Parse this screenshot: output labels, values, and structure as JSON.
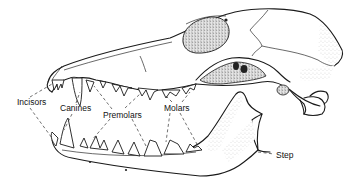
{
  "figure": {
    "ink_color": "#1a1a1a",
    "background": "#ffffff"
  },
  "labels": {
    "incisors": "Incisors",
    "canines": "Canines",
    "premolars": "Premolars",
    "molars": "Molars",
    "step": "Step"
  },
  "label_positions": {
    "incisors": {
      "x": 17,
      "y": 98
    },
    "canines": {
      "x": 60,
      "y": 104
    },
    "premolars": {
      "x": 103,
      "y": 111
    },
    "molars": {
      "x": 164,
      "y": 104
    },
    "step": {
      "x": 276,
      "y": 151
    }
  }
}
